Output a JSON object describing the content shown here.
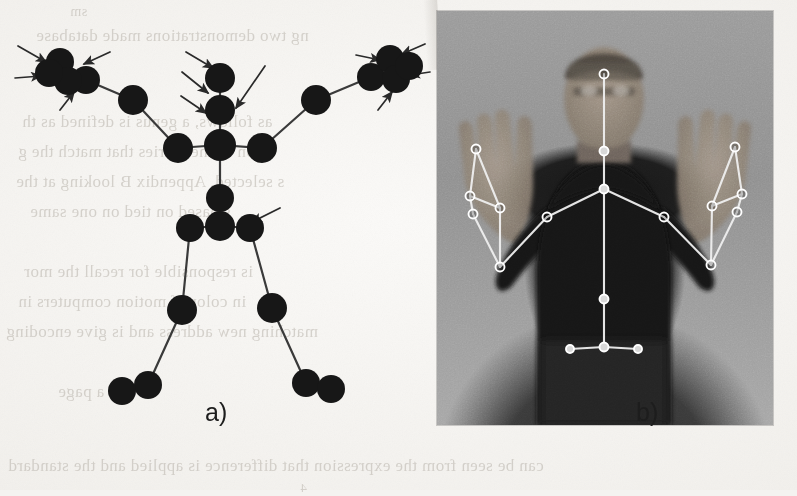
{
  "figure": {
    "panels": [
      {
        "id": "a",
        "caption": "a)",
        "kind": "stick-figure-diagram"
      },
      {
        "id": "b",
        "caption": "b)",
        "kind": "photograph-with-skeleton-overlay"
      }
    ]
  },
  "captions": {
    "panel_a": "a)",
    "panel_b": "b)"
  },
  "colors": {
    "page": "#f4f3f0",
    "joint": "#171717",
    "bone": "#3a3a3a",
    "arrow": "#2a2a2a",
    "overlay_line": "#efefef",
    "overlay_joint_fill": "#d8d8d8",
    "overlay_joint_stroke": "#ffffff",
    "caption_text": "#1d1d1d",
    "ghost_text": "#b9b4ac"
  },
  "panel_a": {
    "label": "Stick figure skeleton model with highlighted joints",
    "joints": [
      {
        "name": "head",
        "x": 220,
        "y": 78,
        "r": 15
      },
      {
        "name": "neck",
        "x": 220,
        "y": 110,
        "r": 15
      },
      {
        "name": "shoulder-center",
        "x": 220,
        "y": 145,
        "r": 16
      },
      {
        "name": "shoulder-left",
        "x": 178,
        "y": 148,
        "r": 15
      },
      {
        "name": "shoulder-right",
        "x": 262,
        "y": 148,
        "r": 15
      },
      {
        "name": "elbow-left",
        "x": 133,
        "y": 100,
        "r": 15
      },
      {
        "name": "elbow-right",
        "x": 316,
        "y": 100,
        "r": 15
      },
      {
        "name": "wrist-left",
        "x": 86,
        "y": 80,
        "r": 14
      },
      {
        "name": "wrist-right",
        "x": 371,
        "y": 77,
        "r": 14
      },
      {
        "name": "hand-left-a",
        "x": 60,
        "y": 62,
        "r": 14
      },
      {
        "name": "hand-left-b",
        "x": 68,
        "y": 81,
        "r": 14
      },
      {
        "name": "hand-left-c",
        "x": 49,
        "y": 73,
        "r": 14
      },
      {
        "name": "hand-right-a",
        "x": 390,
        "y": 59,
        "r": 14
      },
      {
        "name": "hand-right-b",
        "x": 396,
        "y": 79,
        "r": 14
      },
      {
        "name": "hand-right-c",
        "x": 409,
        "y": 66,
        "r": 14
      },
      {
        "name": "spine-mid",
        "x": 220,
        "y": 198,
        "r": 14
      },
      {
        "name": "hip-center",
        "x": 220,
        "y": 226,
        "r": 15
      },
      {
        "name": "hip-left",
        "x": 190,
        "y": 228,
        "r": 14
      },
      {
        "name": "hip-right",
        "x": 250,
        "y": 228,
        "r": 14
      },
      {
        "name": "knee-left",
        "x": 182,
        "y": 310,
        "r": 15
      },
      {
        "name": "knee-right",
        "x": 272,
        "y": 308,
        "r": 15
      },
      {
        "name": "ankle-left",
        "x": 148,
        "y": 385,
        "r": 14
      },
      {
        "name": "ankle-right",
        "x": 306,
        "y": 383,
        "r": 14
      },
      {
        "name": "foot-left",
        "x": 122,
        "y": 391,
        "r": 14
      },
      {
        "name": "foot-right",
        "x": 331,
        "y": 389,
        "r": 14
      }
    ],
    "bones": [
      [
        "head",
        "neck"
      ],
      [
        "neck",
        "shoulder-center"
      ],
      [
        "shoulder-center",
        "shoulder-left"
      ],
      [
        "shoulder-center",
        "shoulder-right"
      ],
      [
        "shoulder-left",
        "elbow-left"
      ],
      [
        "elbow-left",
        "wrist-left"
      ],
      [
        "shoulder-right",
        "elbow-right"
      ],
      [
        "elbow-right",
        "wrist-right"
      ],
      [
        "wrist-left",
        "hand-left-b"
      ],
      [
        "wrist-right",
        "hand-right-b"
      ],
      [
        "shoulder-center",
        "spine-mid"
      ],
      [
        "spine-mid",
        "hip-center"
      ],
      [
        "hip-center",
        "hip-left"
      ],
      [
        "hip-center",
        "hip-right"
      ],
      [
        "hip-left",
        "knee-left"
      ],
      [
        "knee-left",
        "ankle-left"
      ],
      [
        "ankle-left",
        "foot-left"
      ],
      [
        "hip-right",
        "knee-right"
      ],
      [
        "knee-right",
        "ankle-right"
      ],
      [
        "ankle-right",
        "foot-right"
      ]
    ],
    "arrows": [
      {
        "name": "arrow-hand-left-top",
        "x1": 18,
        "y1": 46,
        "x2": 46,
        "y2": 62
      },
      {
        "name": "arrow-hand-left-side",
        "x1": 15,
        "y1": 78,
        "x2": 41,
        "y2": 76
      },
      {
        "name": "arrow-hand-left-bottom",
        "x1": 60,
        "y1": 110,
        "x2": 74,
        "y2": 92
      },
      {
        "name": "arrow-hand-left-right",
        "x1": 110,
        "y1": 52,
        "x2": 84,
        "y2": 64
      },
      {
        "name": "arrow-head",
        "x1": 186,
        "y1": 52,
        "x2": 213,
        "y2": 68
      },
      {
        "name": "arrow-neck",
        "x1": 182,
        "y1": 72,
        "x2": 208,
        "y2": 93
      },
      {
        "name": "arrow-shoulder-center",
        "x1": 181,
        "y1": 96,
        "x2": 206,
        "y2": 113
      },
      {
        "name": "arrow-shoulder-right-top",
        "x1": 265,
        "y1": 66,
        "x2": 236,
        "y2": 108
      },
      {
        "name": "arrow-hip-right",
        "x1": 280,
        "y1": 208,
        "x2": 252,
        "y2": 222
      },
      {
        "name": "arrow-hand-right-top",
        "x1": 425,
        "y1": 44,
        "x2": 402,
        "y2": 54
      },
      {
        "name": "arrow-hand-right-left",
        "x1": 356,
        "y1": 55,
        "x2": 380,
        "y2": 60
      },
      {
        "name": "arrow-hand-right-side",
        "x1": 430,
        "y1": 72,
        "x2": 410,
        "y2": 75
      },
      {
        "name": "arrow-hand-right-bottom",
        "x1": 378,
        "y1": 110,
        "x2": 392,
        "y2": 92
      }
    ],
    "arrow_count": 13
  },
  "panel_b": {
    "label": "Grayscale photograph of a person with arms raised and white skeleton overlay",
    "photo_rect": {
      "left": 437,
      "top": 11,
      "width": 336,
      "height": 414
    },
    "overlay_joints": [
      {
        "name": "head",
        "x": 167,
        "y": 63,
        "r": 4.5,
        "filled": false
      },
      {
        "name": "neck",
        "x": 167,
        "y": 140,
        "r": 4.5,
        "filled": true
      },
      {
        "name": "shoulder-center",
        "x": 167,
        "y": 178,
        "r": 4.5,
        "filled": true
      },
      {
        "name": "shoulder-left",
        "x": 110,
        "y": 206,
        "r": 4.5,
        "filled": false
      },
      {
        "name": "shoulder-right",
        "x": 227,
        "y": 206,
        "r": 4.5,
        "filled": false
      },
      {
        "name": "elbow-left",
        "x": 63,
        "y": 256,
        "r": 4.5,
        "filled": false
      },
      {
        "name": "elbow-right",
        "x": 274,
        "y": 254,
        "r": 4.5,
        "filled": false
      },
      {
        "name": "wrist-left",
        "x": 63,
        "y": 197,
        "r": 4.5,
        "filled": false
      },
      {
        "name": "wrist-right",
        "x": 275,
        "y": 195,
        "r": 4.5,
        "filled": false
      },
      {
        "name": "hand-left-a",
        "x": 39,
        "y": 138,
        "r": 4.5,
        "filled": false
      },
      {
        "name": "hand-left-b",
        "x": 33,
        "y": 185,
        "r": 4.5,
        "filled": false
      },
      {
        "name": "hand-left-c",
        "x": 36,
        "y": 203,
        "r": 4.5,
        "filled": false
      },
      {
        "name": "hand-right-a",
        "x": 298,
        "y": 136,
        "r": 4.5,
        "filled": false
      },
      {
        "name": "hand-right-b",
        "x": 305,
        "y": 183,
        "r": 4.5,
        "filled": false
      },
      {
        "name": "hand-right-c",
        "x": 300,
        "y": 201,
        "r": 4.5,
        "filled": false
      },
      {
        "name": "spine-mid",
        "x": 167,
        "y": 288,
        "r": 4.5,
        "filled": true
      },
      {
        "name": "hip-center",
        "x": 167,
        "y": 336,
        "r": 4.5,
        "filled": true
      },
      {
        "name": "hip-left",
        "x": 133,
        "y": 338,
        "r": 4.0,
        "filled": true
      },
      {
        "name": "hip-right",
        "x": 201,
        "y": 338,
        "r": 4.0,
        "filled": true
      }
    ],
    "overlay_bones": [
      [
        "head",
        "neck"
      ],
      [
        "neck",
        "shoulder-center"
      ],
      [
        "shoulder-center",
        "shoulder-left"
      ],
      [
        "shoulder-center",
        "shoulder-right"
      ],
      [
        "shoulder-left",
        "elbow-left"
      ],
      [
        "elbow-left",
        "wrist-left"
      ],
      [
        "shoulder-right",
        "elbow-right"
      ],
      [
        "elbow-right",
        "wrist-right"
      ],
      [
        "wrist-left",
        "hand-left-a"
      ],
      [
        "wrist-left",
        "hand-left-b"
      ],
      [
        "hand-left-b",
        "hand-left-c"
      ],
      [
        "hand-left-a",
        "hand-left-b"
      ],
      [
        "hand-left-c",
        "elbow-left"
      ],
      [
        "wrist-right",
        "hand-right-a"
      ],
      [
        "wrist-right",
        "hand-right-b"
      ],
      [
        "hand-right-b",
        "hand-right-c"
      ],
      [
        "hand-right-a",
        "hand-right-b"
      ],
      [
        "hand-right-c",
        "elbow-right"
      ],
      [
        "shoulder-center",
        "spine-mid"
      ],
      [
        "spine-mid",
        "hip-center"
      ],
      [
        "hip-center",
        "hip-left"
      ],
      [
        "hip-center",
        "hip-right"
      ]
    ]
  },
  "bleed_through_text": [
    {
      "name": "ghost-line-1",
      "text": "ng two demonstrations made database",
      "x": 36,
      "y": 26,
      "size": 17
    },
    {
      "name": "ghost-line-2",
      "text": "as follows, a genus is defined as th",
      "x": 22,
      "y": 112,
      "size": 17
    },
    {
      "name": "ghost-line-3",
      "text": "on  of the entries that  match the g",
      "x": 18,
      "y": 142,
      "size": 17
    },
    {
      "name": "ghost-line-4",
      "text": "s selected. Appendix B  looking at the",
      "x": 16,
      "y": 172,
      "size": 17
    },
    {
      "name": "ghost-line-5",
      "text": "s based on tied on one same",
      "x": 30,
      "y": 202,
      "size": 17
    },
    {
      "name": "ghost-line-6",
      "text": "is responsible for recall  the mor",
      "x": 24,
      "y": 262,
      "size": 17
    },
    {
      "name": "ghost-line-7",
      "text": "in color of motion computers in",
      "x": 18,
      "y": 292,
      "size": 17
    },
    {
      "name": "ghost-line-8",
      "text": "matching  new address and is give encoding",
      "x": 6,
      "y": 322,
      "size": 17
    },
    {
      "name": "ghost-line-9",
      "text": "es a page",
      "x": 58,
      "y": 382,
      "size": 17
    },
    {
      "name": "ghost-line-10",
      "text": "can be seen from the expression  that difference is applied  and the  standard",
      "x": 8,
      "y": 456,
      "size": 17
    },
    {
      "name": "ghost-line-11",
      "text": "sm",
      "x": 70,
      "y": 4,
      "size": 14
    },
    {
      "name": "ghost-line-12",
      "text": "on",
      "x": 650,
      "y": 112,
      "size": 15
    },
    {
      "name": "ghost-line-13",
      "text": "4",
      "x": 300,
      "y": 480,
      "size": 13
    }
  ]
}
